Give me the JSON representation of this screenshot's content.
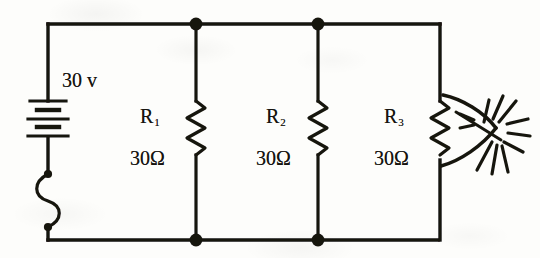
{
  "diagram": {
    "type": "electrical-schematic",
    "ink_color": "#16140f",
    "paper_color": "#fdfdfb"
  },
  "source": {
    "component": "battery",
    "label": "30 v",
    "voltage_value": 30,
    "voltage_unit": "v"
  },
  "fuse": {
    "component": "fuse",
    "label": ""
  },
  "resistors": [
    {
      "designator": "R",
      "subscript": "1",
      "value_label": "30Ω",
      "resistance": 30,
      "unit": "Ω",
      "status": "normal"
    },
    {
      "designator": "R",
      "subscript": "2",
      "value_label": "30Ω",
      "resistance": 30,
      "unit": "Ω",
      "status": "normal"
    },
    {
      "designator": "R",
      "subscript": "3",
      "value_label": "30Ω",
      "resistance": 30,
      "unit": "Ω",
      "status": "burning"
    }
  ],
  "burst": {
    "component": "spark-burst",
    "attached_to": "R3"
  },
  "nodes": {
    "top_junction_count": 2,
    "bottom_junction_count": 2
  }
}
